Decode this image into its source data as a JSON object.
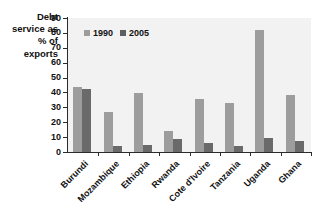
{
  "chart_data": {
    "type": "bar",
    "title": "",
    "xlabel": "",
    "ylabel": "Debt service as % of exports",
    "ylabel_lines": [
      "Debt",
      "service as",
      "% of",
      "exports"
    ],
    "ylim": [
      0,
      90
    ],
    "yticks": [
      0,
      10,
      20,
      30,
      40,
      50,
      60,
      70,
      80,
      90
    ],
    "grid": false,
    "legend_position": "upper-left-inside",
    "categories": [
      "Burundi",
      "Mozambique",
      "Ethiopia",
      "Rwanda",
      "Cote d'Ivoire",
      "Tanzania",
      "Uganda",
      "Ghana"
    ],
    "series": [
      {
        "name": "1990",
        "color": "#9d9d9d",
        "values": [
          43.5,
          27,
          39.5,
          14,
          35.5,
          33,
          82,
          38.5
        ]
      },
      {
        "name": "2005",
        "color": "#6a6a6a",
        "values": [
          42,
          4,
          4.5,
          8.5,
          6,
          4,
          9.5,
          7.5
        ]
      }
    ],
    "plot_background": "#f2f2f2",
    "axis_color": "#2b2b2b"
  }
}
